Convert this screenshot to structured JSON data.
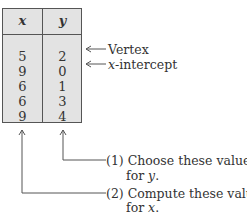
{
  "table": {
    "headers": [
      "x",
      "y"
    ],
    "rows": [
      {
        "x": "5",
        "y": "2"
      },
      {
        "x": "9",
        "y": "0"
      },
      {
        "x": "6",
        "y": "1"
      },
      {
        "x": "6",
        "y": "3"
      },
      {
        "x": "9",
        "y": "4"
      }
    ]
  },
  "annotations": {
    "vertex": "Vertex",
    "x_intercept_var": "x",
    "x_intercept_rest": "-intercept",
    "step1_line1": "(1) Choose these values",
    "step1_line2_pre": "for ",
    "step1_line2_var": "y",
    "step1_line2_post": ".",
    "step2_line1": "(2) Compute these values",
    "step2_line2_pre": "for ",
    "step2_line2_var": "x",
    "step2_line2_post": "."
  }
}
